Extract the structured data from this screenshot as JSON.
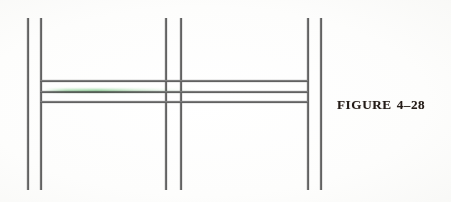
{
  "figure": {
    "caption_label": "FIGURE",
    "caption_number": "4–28",
    "caption_full": "FIGURE 4–28",
    "media": "scanned book page line diagram",
    "background_color": "#fefefe",
    "ink_color": "#333333",
    "caption_color": "#231c18",
    "scan_artifact_color": "#60c46e"
  },
  "diagram": {
    "vertical_lines": [
      {
        "name": "left-outer-vertical",
        "x": 27,
        "y_top": 18,
        "y_bottom": 190,
        "thickness": 2
      },
      {
        "name": "left-inner-vertical",
        "x": 40,
        "y_top": 18,
        "y_bottom": 190,
        "thickness": 2
      },
      {
        "name": "middle-left-vertical",
        "x": 165,
        "y_top": 18,
        "y_bottom": 190,
        "thickness": 2
      },
      {
        "name": "middle-right-vertical",
        "x": 180,
        "y_top": 18,
        "y_bottom": 190,
        "thickness": 2
      },
      {
        "name": "right-inner-vertical",
        "x": 307,
        "y_top": 18,
        "y_bottom": 190,
        "thickness": 2
      },
      {
        "name": "right-outer-vertical",
        "x": 320,
        "y_top": 18,
        "y_bottom": 190,
        "thickness": 2
      }
    ],
    "horizontal_lines": [
      {
        "name": "upper-horizontal",
        "y": 80,
        "x_start": 40,
        "x_end": 308,
        "thickness": 2
      },
      {
        "name": "middle-horizontal",
        "y": 91,
        "x_start": 40,
        "x_end": 308,
        "thickness": 2
      },
      {
        "name": "lower-horizontal",
        "y": 101,
        "x_start": 40,
        "x_end": 308,
        "thickness": 2
      }
    ],
    "scan_artifact": {
      "y": 90,
      "x_start": 44,
      "x_end": 200
    },
    "caption_position": {
      "x": 337,
      "y": 95
    }
  }
}
